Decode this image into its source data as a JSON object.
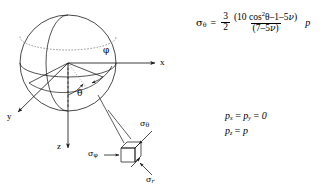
{
  "figure": {
    "type": "spherical-cavity-stress-diagram"
  },
  "axes": {
    "x_label": "x",
    "y_label": "y",
    "z_label": "z"
  },
  "angles": {
    "azimuthal_label": "φ",
    "polar_label": "θ"
  },
  "stress_element": {
    "hoop_theta": {
      "symbol": "σ",
      "sub": "θ"
    },
    "hoop_phi": {
      "symbol": "σ",
      "sub": "φ"
    },
    "radial": {
      "symbol": "σ",
      "sub": "r"
    }
  },
  "equation": {
    "lhs_symbol": "σ",
    "lhs_sub": "θ",
    "equals": "=",
    "coef_num": "3",
    "coef_den": "2",
    "frac_numerator_open": "(10 cos",
    "frac_numerator_exp": "2",
    "frac_numerator_theta": "θ",
    "frac_numerator_rest": "–1–5",
    "frac_numerator_nu": "ν",
    "frac_numerator_close": ")",
    "frac_denominator": "(7–5",
    "frac_denominator_nu": "ν",
    "frac_denominator_close": ")",
    "rhs_p": "p",
    "plain_text": "σθ = (3/2) (10 cos²θ – 1 – 5ν)/(7–5ν) p"
  },
  "pressure_conditions": {
    "line1": "pₓ = pᵧ = 0",
    "line2": "p_z = p",
    "px_symbol": "p",
    "px_sub": "x",
    "py_symbol": "p",
    "py_sub": "y",
    "pxy_equals": "=",
    "pxy_value": "0",
    "pz_symbol": "p",
    "pz_sub": "z",
    "pz_equals": "=",
    "pz_value": "p"
  },
  "colors": {
    "stroke": "#1a1a1a",
    "dotted": "#8a8a8a",
    "background": "#ffffff"
  }
}
